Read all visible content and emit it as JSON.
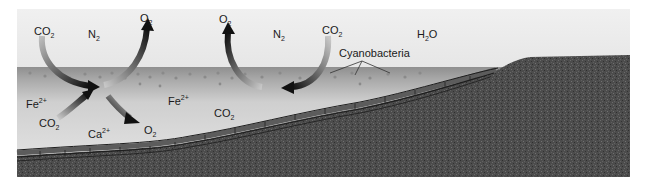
{
  "diagram": {
    "title": "",
    "colors": {
      "sky": "#ebebeb",
      "water_surface": "#9a9a9a",
      "water_deep": "#d4d4d4",
      "sediment": "#4a4a4a",
      "stromatolite_layer": "#6a6a6a",
      "arrow_dark": "#111111"
    },
    "labels": {
      "co2_top_left": {
        "base": "CO",
        "sub": "2"
      },
      "n2_left": {
        "base": "N",
        "sub": "2"
      },
      "o2_top_left": {
        "base": "O",
        "sub": "2"
      },
      "o2_top_mid": {
        "base": "O",
        "sub": "2"
      },
      "n2_mid": {
        "base": "N",
        "sub": "2"
      },
      "co2_top_mid": {
        "base": "CO",
        "sub": "2"
      },
      "h2o": {
        "base": "H",
        "sub": "2",
        "tail": "O"
      },
      "cyanobacteria": "Cyanobacteria",
      "fe_left": {
        "base": "Fe",
        "sup": "2+"
      },
      "fe_mid": {
        "base": "Fe",
        "sup": "2+"
      },
      "co2_lower_left": {
        "base": "CO",
        "sub": "2"
      },
      "ca": {
        "base": "Ca",
        "sup": "2+"
      },
      "o2_lower": {
        "base": "O",
        "sub": "2"
      },
      "co2_water": {
        "base": "CO",
        "sub": "2"
      }
    },
    "arrows": [
      {
        "name": "co2-into-water-arrow",
        "from": "CO2 (air)",
        "to": "water"
      },
      {
        "name": "o2-out-of-water-arrow-left",
        "from": "water",
        "to": "O2 (air)"
      },
      {
        "name": "co2-lower-arrow",
        "from": "CO2 (water)",
        "to": "bacteria"
      },
      {
        "name": "o2-down-arrow",
        "from": "bacteria",
        "to": "O2 (water)"
      },
      {
        "name": "o2-out-of-water-arrow-mid",
        "from": "water",
        "to": "O2 (air)"
      },
      {
        "name": "co2-into-water-arrow-mid",
        "from": "CO2 (air)",
        "to": "water"
      }
    ]
  }
}
